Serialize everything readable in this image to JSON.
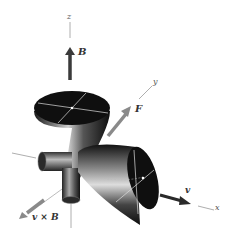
{
  "diagram": {
    "axes": {
      "z": "z",
      "y": "y",
      "x": "x"
    },
    "vectors": {
      "B": "B",
      "F": "F",
      "v": "v",
      "vxB": "v × B"
    },
    "colors": {
      "cone": "#111111",
      "arrow_dark": "#3a3a3a",
      "arrow_light": "#8a8a8a",
      "axis": "#999999"
    }
  }
}
